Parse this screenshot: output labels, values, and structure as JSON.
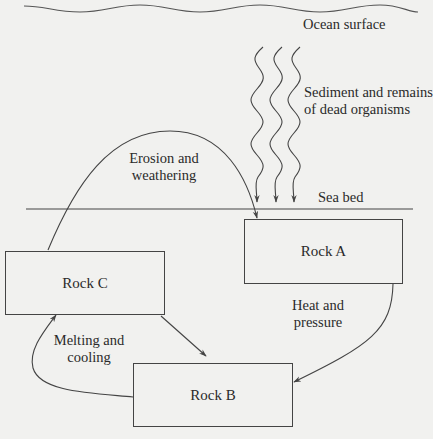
{
  "diagram": {
    "type": "rock-cycle",
    "labels": {
      "ocean_surface": "Ocean surface",
      "sediment": [
        "Sediment and remains",
        "of dead organisms"
      ],
      "sea_bed": "Sea bed",
      "erosion": [
        "Erosion and",
        "weathering"
      ],
      "heat": [
        "Heat and",
        "pressure"
      ],
      "melting": [
        "Melting and",
        "cooling"
      ]
    },
    "nodes": [
      {
        "id": "rock_a",
        "label": "Rock A"
      },
      {
        "id": "rock_b",
        "label": "Rock B"
      },
      {
        "id": "rock_c",
        "label": "Rock C"
      }
    ],
    "edges": [
      {
        "from": "rock_c",
        "to": "rock_a",
        "label": "Erosion and weathering"
      },
      {
        "from": "rock_a",
        "to": "rock_b",
        "label": "Heat and pressure"
      },
      {
        "from": "rock_b",
        "to": "rock_c",
        "label": "Melting and cooling"
      },
      {
        "from": "rock_c",
        "to": "rock_b",
        "label": ""
      },
      {
        "from": "ocean_surface",
        "to": "sea_bed",
        "label": "Sediment and remains of dead organisms"
      }
    ],
    "colors": {
      "background": "#f1f1ef",
      "line": "#444444",
      "text": "#2a2a2a"
    }
  }
}
